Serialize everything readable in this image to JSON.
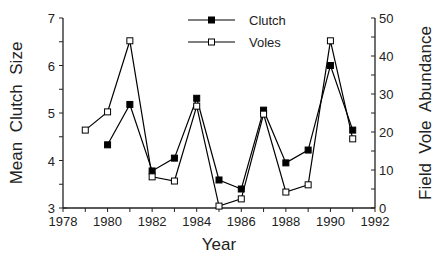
{
  "chart_data": {
    "type": "line",
    "title": "",
    "xlabel": "Year",
    "ylabel": "Mean  Clutch  Size",
    "y2label": "Field  Vole  Abundance",
    "xlim": [
      1978,
      1992
    ],
    "ylim": [
      3,
      7
    ],
    "y2lim": [
      0,
      50
    ],
    "x_ticks": [
      1978,
      1980,
      1982,
      1984,
      1986,
      1988,
      1990,
      1992
    ],
    "y_ticks": [
      3,
      4,
      5,
      6,
      7
    ],
    "y2_ticks": [
      0,
      10,
      20,
      30,
      40,
      50
    ],
    "grid": false,
    "legend_position": "top-center",
    "series": [
      {
        "name": "Clutch",
        "axis": "left",
        "marker": "filled-square",
        "color": "#000000",
        "x": [
          1980,
          1981,
          1982,
          1983,
          1984,
          1985,
          1986,
          1987,
          1988,
          1989,
          1990,
          1991
        ],
        "values": [
          4.33,
          5.18,
          3.78,
          4.05,
          5.31,
          3.59,
          3.4,
          5.06,
          3.95,
          4.22,
          6.0,
          4.64
        ]
      },
      {
        "name": "Voles",
        "axis": "right",
        "marker": "open-square",
        "color": "#000000",
        "x": [
          1979,
          1980,
          1981,
          1982,
          1983,
          1984,
          1985,
          1986,
          1987,
          1988,
          1989,
          1990,
          1991
        ],
        "values": [
          20.5,
          25.3,
          44.0,
          8.2,
          7.1,
          26.8,
          0.5,
          2.4,
          24.7,
          4.2,
          6.1,
          44.0,
          18.2
        ]
      }
    ]
  }
}
